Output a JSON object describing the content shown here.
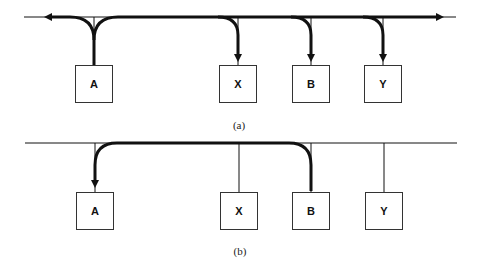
{
  "diagram": {
    "panels": [
      {
        "caption": "(a)",
        "description": "Broadcast: station A transmits in both directions; signal reaches X, B, Y",
        "nodes": [
          {
            "id": "A",
            "label": "A"
          },
          {
            "id": "X",
            "label": "X"
          },
          {
            "id": "B",
            "label": "B"
          },
          {
            "id": "Y",
            "label": "Y"
          }
        ],
        "flows": [
          {
            "from": "A",
            "to": "bus-left-end"
          },
          {
            "from": "A",
            "to": "bus-right-end"
          },
          {
            "from": "A",
            "to": "X"
          },
          {
            "from": "A",
            "to": "B"
          },
          {
            "from": "A",
            "to": "Y"
          }
        ]
      },
      {
        "caption": "(b)",
        "description": "Station B transmits to A over the shared bus",
        "nodes": [
          {
            "id": "A",
            "label": "A"
          },
          {
            "id": "X",
            "label": "X"
          },
          {
            "id": "B",
            "label": "B"
          },
          {
            "id": "Y",
            "label": "Y"
          }
        ],
        "flows": [
          {
            "from": "B",
            "to": "A"
          }
        ]
      }
    ],
    "colors": {
      "line": "#111111",
      "box_border": "#333333",
      "background": "#ffffff"
    }
  }
}
